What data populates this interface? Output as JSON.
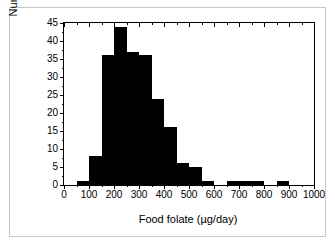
{
  "figure": {
    "background_color": "#ffffff",
    "frame_color": "#000000",
    "outer_border_color": "#c9c9c9",
    "bar_color": "#000000"
  },
  "chart_data": {
    "type": "bar",
    "title": "",
    "subtitle": "",
    "xlabel": "Food folate (µg/day)",
    "ylabel": "Number of subjects",
    "xlim": [
      0,
      1000
    ],
    "ylim": [
      0,
      45
    ],
    "grid": false,
    "legend": null,
    "bin_width": 50,
    "x_tick_labels": [
      "0",
      "100",
      "200",
      "300",
      "400",
      "500",
      "600",
      "700",
      "800",
      "900",
      "1000"
    ],
    "x_tick_values": [
      0,
      100,
      200,
      300,
      400,
      500,
      600,
      700,
      800,
      900,
      1000
    ],
    "x_minor_tick_values": [
      50,
      150,
      250,
      350,
      450,
      550,
      650,
      750,
      850,
      950
    ],
    "y_tick_labels": [
      "0",
      "5",
      "10",
      "15",
      "20",
      "25",
      "30",
      "35",
      "40",
      "45"
    ],
    "y_tick_values": [
      0,
      5,
      10,
      15,
      20,
      25,
      30,
      35,
      40,
      45
    ],
    "y_minor_tick_values": [
      2.5,
      7.5,
      12.5,
      17.5,
      22.5,
      27.5,
      32.5,
      37.5,
      42.5
    ],
    "bins": [
      {
        "start": 0,
        "end": 50,
        "value": 0
      },
      {
        "start": 50,
        "end": 100,
        "value": 1
      },
      {
        "start": 100,
        "end": 150,
        "value": 8
      },
      {
        "start": 150,
        "end": 200,
        "value": 36
      },
      {
        "start": 200,
        "end": 250,
        "value": 44
      },
      {
        "start": 250,
        "end": 300,
        "value": 37
      },
      {
        "start": 300,
        "end": 350,
        "value": 36
      },
      {
        "start": 350,
        "end": 400,
        "value": 24
      },
      {
        "start": 400,
        "end": 450,
        "value": 16
      },
      {
        "start": 450,
        "end": 500,
        "value": 6
      },
      {
        "start": 500,
        "end": 550,
        "value": 5
      },
      {
        "start": 550,
        "end": 600,
        "value": 1
      },
      {
        "start": 600,
        "end": 650,
        "value": 0
      },
      {
        "start": 650,
        "end": 700,
        "value": 1
      },
      {
        "start": 700,
        "end": 750,
        "value": 1
      },
      {
        "start": 750,
        "end": 800,
        "value": 1
      },
      {
        "start": 800,
        "end": 850,
        "value": 0
      },
      {
        "start": 850,
        "end": 900,
        "value": 1
      },
      {
        "start": 900,
        "end": 950,
        "value": 0
      },
      {
        "start": 950,
        "end": 1000,
        "value": 0
      }
    ],
    "categories": [
      "50-100",
      "100-150",
      "150-200",
      "200-250",
      "250-300",
      "300-350",
      "350-400",
      "400-450",
      "450-500",
      "500-550",
      "550-600",
      "600-650",
      "650-700",
      "700-750",
      "750-800",
      "800-850",
      "850-900"
    ],
    "values": [
      1,
      8,
      36,
      44,
      37,
      36,
      24,
      16,
      6,
      5,
      1,
      0,
      1,
      1,
      1,
      0,
      1
    ]
  }
}
